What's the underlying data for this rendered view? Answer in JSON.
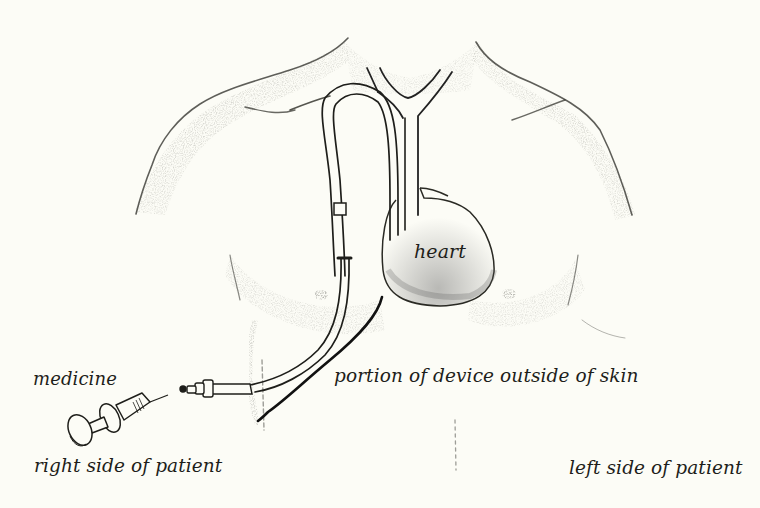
{
  "figure": {
    "type": "medical-illustration",
    "background_color": "#fcfcf6",
    "ink_color": "#1e1e1a"
  },
  "labels": {
    "heart": "heart",
    "medicine": "medicine",
    "device_outside_skin": "portion of device outside of skin",
    "right_side": "right side of patient",
    "left_side": "left side of patient"
  },
  "parts": [
    {
      "name": "torso",
      "description": "shaded outline of shoulders and chest"
    },
    {
      "name": "veins",
      "description": "Y-shaped jugular/subclavian veins leading to heart"
    },
    {
      "name": "heart",
      "description": "heart shape in center of chest"
    },
    {
      "name": "catheter",
      "description": "double-lumen tube looping over the clavicle into vein"
    },
    {
      "name": "cuff",
      "description": "small square cuff on catheter"
    },
    {
      "name": "exit-line",
      "description": "bracket line showing external portion"
    },
    {
      "name": "hub",
      "description": "catheter connector hub"
    },
    {
      "name": "syringe",
      "description": "syringe with medicine"
    }
  ]
}
